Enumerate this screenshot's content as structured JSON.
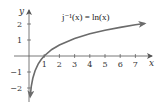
{
  "chart_data": {
    "type": "line",
    "title": "j⁻¹(x) = ln(x)",
    "xlabel": "x",
    "ylabel": "y",
    "x_ticks": [
      1,
      2,
      3,
      4,
      5,
      6,
      7
    ],
    "y_ticks": [
      -2,
      -1,
      1,
      2
    ],
    "xlim": [
      -0.9,
      8
    ],
    "ylim": [
      -2.8,
      2.9
    ],
    "grid": false,
    "legend": null,
    "series": [
      {
        "name": "ln(x)",
        "color": "#6b6b6b",
        "x": [
          0.08,
          0.15,
          0.25,
          0.4,
          0.6,
          0.8,
          1,
          1.5,
          2,
          3,
          4,
          5,
          6,
          7,
          7.6
        ],
        "y": [
          -2.53,
          -1.9,
          -1.39,
          -0.92,
          -0.51,
          -0.22,
          0,
          0.41,
          0.69,
          1.1,
          1.39,
          1.61,
          1.79,
          1.95,
          2.03
        ]
      }
    ]
  },
  "labels": {
    "title": "j⁻¹(x) = ln(x)",
    "x_axis": "x",
    "y_axis": "y",
    "x_tick_1": "1",
    "x_tick_2": "2",
    "x_tick_3": "3",
    "x_tick_4": "4",
    "x_tick_5": "5",
    "x_tick_6": "6",
    "x_tick_7": "7",
    "y_tick_2": "2",
    "y_tick_1": "1",
    "y_tick_m1": "−1",
    "y_tick_m2": "−2"
  },
  "colors": {
    "axis": "#555555",
    "curve": "#6b6b6b",
    "text": "#333333"
  }
}
